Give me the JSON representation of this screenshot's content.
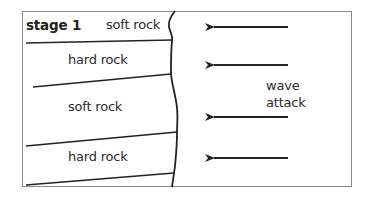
{
  "diagram": {
    "stage_label": "stage 1",
    "layers": [
      {
        "label": "soft rock"
      },
      {
        "label": "hard rock"
      },
      {
        "label": "soft rock"
      },
      {
        "label": "hard rock"
      }
    ],
    "wave_label_line1": "wave",
    "wave_label_line2": "attack",
    "arrow_count": 4,
    "colors": {
      "line": "#222222",
      "frame": "#8a8a8a",
      "text": "#2a2a2a"
    }
  }
}
